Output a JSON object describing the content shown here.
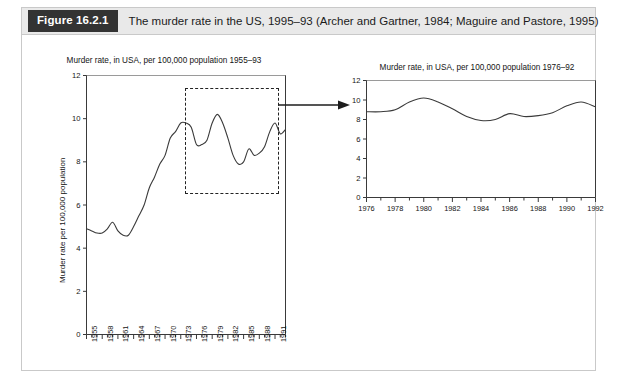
{
  "figure": {
    "number_label": "Figure 16.2.1",
    "caption": "The murder rate in the US, 1995–93 (Archer and Gartner, 1984; Maguire and Pastore, 1995)",
    "accent_color": "#333333",
    "caption_bg": "#e9e9e9",
    "frame_border": "#c9c9c9",
    "line_color": "#3a3a3a"
  },
  "annotations": {
    "highlight_box_name": "dashed-highlight-rectangle",
    "arrow_name": "zoom-arrow"
  },
  "chart_data": [
    {
      "id": "left",
      "type": "line",
      "title": "Murder rate, in USA, per 100,000 population 1955–93",
      "xlabel": "",
      "ylabel": "Murder rate per 100,000 population",
      "xlim": [
        1955,
        1993
      ],
      "ylim": [
        0,
        12
      ],
      "yticks": [
        0,
        2,
        4,
        6,
        8,
        10,
        12
      ],
      "ytick_labels": [
        "0",
        "2",
        "4",
        "6",
        "8",
        "10",
        "12"
      ],
      "xticks": [
        1955,
        1958,
        1961,
        1964,
        1967,
        1970,
        1973,
        1976,
        1979,
        1982,
        1985,
        1988,
        1991
      ],
      "xtick_labels": [
        "1955",
        "1958",
        "1961",
        "1964",
        "1967",
        "1970",
        "1973",
        "1976",
        "1979",
        "1982",
        "1985",
        "1988",
        "1991"
      ],
      "minor_tick_every": 1,
      "grid": false,
      "legend": false,
      "x": [
        1955,
        1956,
        1957,
        1958,
        1959,
        1960,
        1961,
        1962,
        1963,
        1964,
        1965,
        1966,
        1967,
        1968,
        1969,
        1970,
        1971,
        1972,
        1973,
        1974,
        1975,
        1976,
        1977,
        1978,
        1979,
        1980,
        1981,
        1982,
        1983,
        1984,
        1985,
        1986,
        1987,
        1988,
        1989,
        1990,
        1991,
        1992,
        1993
      ],
      "values": [
        4.9,
        4.8,
        4.7,
        4.7,
        4.9,
        5.2,
        4.8,
        4.6,
        4.6,
        5.0,
        5.5,
        6.0,
        6.8,
        7.3,
        7.9,
        8.3,
        9.1,
        9.4,
        9.8,
        9.8,
        9.6,
        8.8,
        8.8,
        9.0,
        9.8,
        10.2,
        9.8,
        9.1,
        8.3,
        7.9,
        8.0,
        8.6,
        8.3,
        8.4,
        8.7,
        9.4,
        9.8,
        9.3,
        9.5
      ]
    },
    {
      "id": "right",
      "type": "line",
      "title": "Murder rate, in USA, per 100,000 population 1976–92",
      "xlabel": "",
      "ylabel": "",
      "xlim": [
        1976,
        1992
      ],
      "ylim": [
        0,
        12
      ],
      "yticks": [
        0,
        2,
        4,
        6,
        8,
        10,
        12
      ],
      "ytick_labels": [
        "0",
        "2",
        "4",
        "6",
        "8",
        "10",
        "12"
      ],
      "xticks": [
        1976,
        1978,
        1980,
        1982,
        1984,
        1986,
        1988,
        1990,
        1992
      ],
      "xtick_labels": [
        "1976",
        "1978",
        "1980",
        "1982",
        "1984",
        "1986",
        "1988",
        "1990",
        "1992"
      ],
      "minor_tick_every": 1,
      "grid": false,
      "legend": false,
      "x": [
        1976,
        1977,
        1978,
        1979,
        1980,
        1981,
        1982,
        1983,
        1984,
        1985,
        1986,
        1987,
        1988,
        1989,
        1990,
        1991,
        1992
      ],
      "values": [
        8.8,
        8.8,
        9.0,
        9.8,
        10.2,
        9.8,
        9.1,
        8.3,
        7.9,
        8.0,
        8.6,
        8.3,
        8.4,
        8.7,
        9.4,
        9.8,
        9.3
      ]
    }
  ]
}
